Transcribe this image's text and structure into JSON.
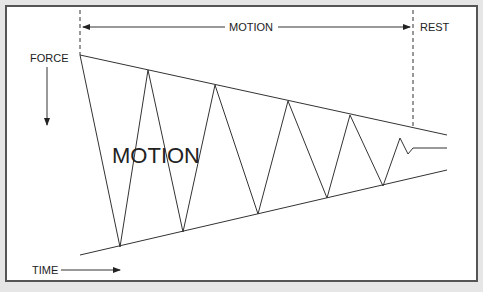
{
  "diagram": {
    "labels": {
      "force": "FORCE",
      "time": "TIME",
      "motion_top": "MOTION",
      "rest": "REST",
      "motion_center": "MOTION"
    },
    "colors": {
      "line": "#333333",
      "text": "#222222",
      "frame": "#555555",
      "background": "#ffffff"
    },
    "envelope": {
      "top": [
        [
          80,
          55
        ],
        [
          447,
          135
        ]
      ],
      "bottom": [
        [
          80,
          255
        ],
        [
          447,
          170
        ]
      ]
    },
    "zigzag": "80,55 120,247 148,70 183,232 215,85 258,214 288,101 327,198 350,115 383,186 400,138 408,154 413,148 447,148"
  }
}
